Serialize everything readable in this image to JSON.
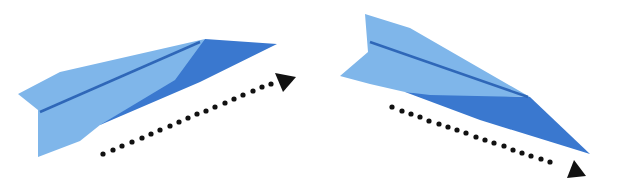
{
  "illustration": {
    "description": "Two paper airplanes with dotted flight-direction arrows",
    "colors": {
      "light_blue": "#7fb6ea",
      "dark_blue": "#3a78cf",
      "crease": "#2f67b8",
      "arrow": "#111111",
      "background": "#ffffff"
    },
    "planes": [
      {
        "id": "left",
        "direction": "up-right"
      },
      {
        "id": "right",
        "direction": "down-right"
      }
    ]
  }
}
